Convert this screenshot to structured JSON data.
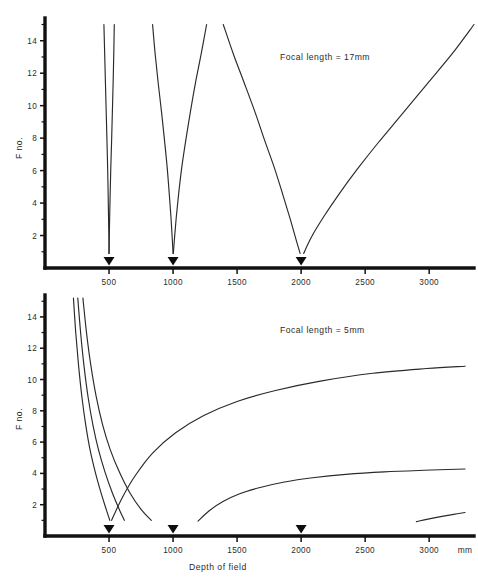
{
  "figure": {
    "background_color": "#ffffff",
    "line_color": "#2a2a2a",
    "axis_color": "#111111"
  },
  "axis_titles": {
    "y": "F no.",
    "x": "Depth of field",
    "x_unit": "mm"
  },
  "ticks": {
    "y_labels": [
      "2",
      "4",
      "6",
      "8",
      "10",
      "12",
      "14"
    ],
    "y_values": [
      2,
      4,
      6,
      8,
      10,
      12,
      14
    ],
    "y_minor_values": [
      1,
      3,
      5,
      7,
      9,
      11,
      13,
      15
    ],
    "x_labels": [
      "500",
      "1000",
      "1500",
      "2000",
      "2500",
      "3000"
    ],
    "x_values": [
      500,
      1000,
      1500,
      2000,
      2500,
      3000
    ]
  },
  "markers": {
    "label": "focus-distance-marker",
    "values": [
      500,
      1000,
      2000
    ]
  },
  "chart_data": [
    {
      "type": "line",
      "id": "focal-17mm",
      "title": "Focal length = 17mm",
      "annotation": "Focal length = 17mm",
      "xlabel": "Depth of field",
      "ylabel": "F no.",
      "xunit": "mm",
      "xlim": [
        0,
        3350
      ],
      "ylim": [
        0,
        15.4
      ],
      "grid": false,
      "legend": "none",
      "series": [
        {
          "name": "focus 500mm - near branch",
          "marker_at": 500,
          "x": [
            460,
            466,
            472,
            478,
            484,
            489,
            493,
            496,
            499,
            500
          ],
          "y": [
            15.0,
            13.2,
            11.4,
            9.6,
            7.8,
            6.2,
            4.6,
            3.2,
            1.9,
            0.9
          ]
        },
        {
          "name": "focus 500mm - far branch",
          "marker_at": 500,
          "x": [
            541,
            537,
            532,
            526,
            520,
            514,
            509,
            505,
            502,
            500
          ],
          "y": [
            15.0,
            13.2,
            11.4,
            9.6,
            7.8,
            6.2,
            4.6,
            3.2,
            1.9,
            0.9
          ]
        },
        {
          "name": "focus 1000mm - near branch",
          "marker_at": 1000,
          "x": [
            840,
            860,
            884,
            910,
            934,
            954,
            970,
            983,
            993,
            1000
          ],
          "y": [
            15.0,
            13.2,
            11.4,
            9.6,
            7.8,
            6.2,
            4.6,
            3.2,
            1.9,
            0.9
          ]
        },
        {
          "name": "focus 1000mm - far branch",
          "marker_at": 1000,
          "x": [
            1262,
            1220,
            1175,
            1135,
            1098,
            1068,
            1044,
            1026,
            1012,
            1002
          ],
          "y": [
            15.0,
            13.2,
            11.4,
            9.6,
            7.8,
            6.2,
            4.6,
            3.2,
            1.9,
            0.9
          ]
        },
        {
          "name": "focus 2000mm - near branch",
          "marker_at": 2000,
          "x": [
            1392,
            1470,
            1556,
            1640,
            1718,
            1790,
            1854,
            1908,
            1955,
            1992
          ],
          "y": [
            15.0,
            13.2,
            11.4,
            9.6,
            7.8,
            6.2,
            4.6,
            3.2,
            1.9,
            0.9
          ]
        },
        {
          "name": "focus 2000mm - far branch",
          "marker_at": 2000,
          "x": [
            2020,
            2080,
            2180,
            2300,
            2440,
            2600,
            2780,
            2980,
            3180,
            3350
          ],
          "y": [
            0.9,
            1.9,
            3.2,
            4.6,
            6.1,
            7.7,
            9.4,
            11.3,
            13.2,
            15.0
          ]
        }
      ]
    },
    {
      "type": "line",
      "id": "focal-5mm",
      "title": "Focal length = 5mm",
      "annotation": "Focal length = 5mm",
      "xlabel": "Depth of field",
      "ylabel": "F no.",
      "xunit": "mm",
      "xlim": [
        0,
        3350
      ],
      "ylim": [
        0,
        15.4
      ],
      "grid": false,
      "legend": "none",
      "series": [
        {
          "name": "near branch A",
          "marker_at": 500,
          "x": [
            222,
            240,
            262,
            288,
            318,
            352,
            392,
            436,
            478,
            506
          ],
          "y": [
            15.2,
            13.0,
            10.9,
            8.9,
            7.1,
            5.5,
            4.1,
            2.8,
            1.7,
            1.0
          ]
        },
        {
          "name": "near branch B",
          "marker_at": 500,
          "x": [
            256,
            278,
            304,
            336,
            374,
            418,
            468,
            524,
            580,
            620
          ],
          "y": [
            15.2,
            13.0,
            10.9,
            8.9,
            7.1,
            5.5,
            4.1,
            2.8,
            1.7,
            1.0
          ]
        },
        {
          "name": "near branch C",
          "marker_at": 1000,
          "x": [
            296,
            324,
            358,
            400,
            450,
            510,
            580,
            660,
            750,
            830
          ],
          "y": [
            15.2,
            13.0,
            10.9,
            8.9,
            7.1,
            5.5,
            4.1,
            2.8,
            1.7,
            1.0
          ]
        },
        {
          "name": "far branch 500mm rising",
          "marker_at": 500,
          "x": [
            520,
            600,
            700,
            840,
            1020,
            1240,
            1500,
            1800,
            2150,
            2560,
            2980,
            3280
          ],
          "y": [
            1.0,
            2.4,
            3.8,
            5.3,
            6.6,
            7.7,
            8.6,
            9.3,
            9.9,
            10.4,
            10.7,
            10.85
          ]
        },
        {
          "name": "far branch 1000mm rising",
          "marker_at": 1000,
          "x": [
            1195,
            1280,
            1390,
            1520,
            1680,
            1870,
            2090,
            2350,
            2650,
            2960,
            3280
          ],
          "y": [
            0.95,
            1.6,
            2.2,
            2.7,
            3.1,
            3.45,
            3.72,
            3.94,
            4.1,
            4.2,
            4.28
          ]
        },
        {
          "name": "far branch 2000mm rising",
          "marker_at": 2000,
          "x": [
            2900,
            2990,
            3090,
            3190,
            3280
          ],
          "y": [
            0.92,
            1.08,
            1.24,
            1.38,
            1.5
          ]
        }
      ]
    }
  ]
}
